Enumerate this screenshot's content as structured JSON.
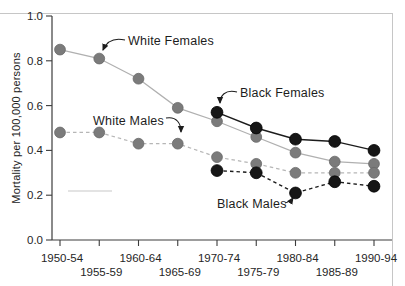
{
  "figure": {
    "background": "#ffffff",
    "frame_color": "#c6c6c6",
    "axis_color": "#3c3c3c",
    "text_color": "#262626",
    "gray_series_color": "#7b7b7b",
    "gray_line_color": "#b0b0b0",
    "black_series_color": "#161616",
    "artifact_line_color": "#dadada"
  },
  "chart_data": {
    "type": "line",
    "title": "",
    "xlabel": "",
    "ylabel": "Mortality per 100,000 persons",
    "ylim": [
      0.0,
      1.0
    ],
    "yticks": [
      0.0,
      0.2,
      0.4,
      0.6,
      0.8,
      1.0
    ],
    "grid": false,
    "legend_position": "none",
    "categories": [
      "1950-54",
      "1955-59",
      "1960-64",
      "1965-69",
      "1970-74",
      "1975-79",
      "1980-84",
      "1985-89",
      "1990-94"
    ],
    "series": [
      {
        "name": "White Females",
        "marker_color": "#7b7b7b",
        "line_color": "#b0b0b0",
        "line_style": "solid",
        "values": [
          0.85,
          0.81,
          0.72,
          0.59,
          0.53,
          0.46,
          0.39,
          0.35,
          0.34
        ]
      },
      {
        "name": "White Males",
        "marker_color": "#7b7b7b",
        "line_color": "#b6b6b6",
        "line_style": "dashed",
        "values": [
          0.48,
          0.48,
          0.43,
          0.43,
          0.37,
          0.34,
          0.3,
          0.3,
          0.3
        ]
      },
      {
        "name": "Black Females",
        "marker_color": "#161616",
        "line_color": "#1c1c1c",
        "line_style": "solid",
        "values": [
          null,
          null,
          null,
          null,
          0.57,
          0.5,
          0.45,
          0.44,
          0.4
        ]
      },
      {
        "name": "Black Males",
        "marker_color": "#161616",
        "line_color": "#1c1c1c",
        "line_style": "dashed",
        "values": [
          null,
          null,
          null,
          null,
          0.31,
          0.3,
          0.21,
          0.26,
          0.24
        ]
      }
    ],
    "annotations": [
      {
        "label": "White Females",
        "arrow": "M 125,40 C 112,37 106,43 103,50"
      },
      {
        "label": "White Males",
        "arrow": "M 166,118 C 177,116 181,124 181,132"
      },
      {
        "label": "Black Females",
        "arrow": "M 237,92 C 225,89 220,96 220,103"
      },
      {
        "label": "Black Males",
        "arrow": "M 285,203 C 289,202 291,201 293,198"
      }
    ]
  }
}
